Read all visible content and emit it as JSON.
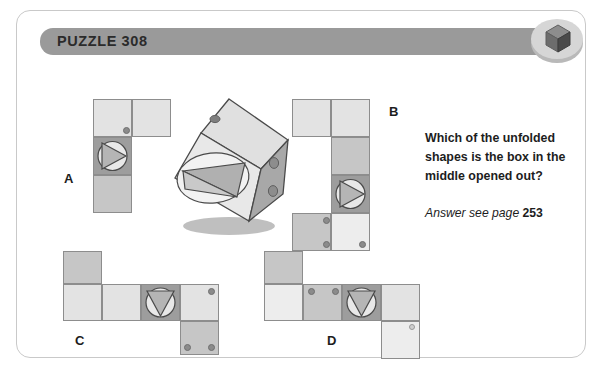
{
  "header": {
    "title": "PUZZLE 308",
    "badge_icon": "cube-icon",
    "bar_color": "#9a9a9a"
  },
  "question": {
    "line1": "Which of the unfolded",
    "line2": "shapes is the box in the",
    "line3": "middle opened out?",
    "answer_prefix": "Answer see page ",
    "answer_page": "253"
  },
  "options": [
    {
      "letter": "A",
      "motif": "circle-triangle-right"
    },
    {
      "letter": "B",
      "motif": "circle-triangle-right"
    },
    {
      "letter": "C",
      "motif": "circle-triangle-down"
    },
    {
      "letter": "D",
      "motif": "circle-triangle-down"
    }
  ],
  "center_figure": {
    "name": "tilted-cube",
    "front_face_motif": "circle-triangle",
    "left_face_dots": 1,
    "right_face_dots": 2
  },
  "colors": {
    "card_border": "#c9c9c9",
    "square_border": "#8d8d8d",
    "light": "#e3e3e3",
    "pale": "#ededed",
    "mid": "#c6c6c6",
    "dark": "#9d9d9d",
    "text": "#1d1d1d"
  }
}
